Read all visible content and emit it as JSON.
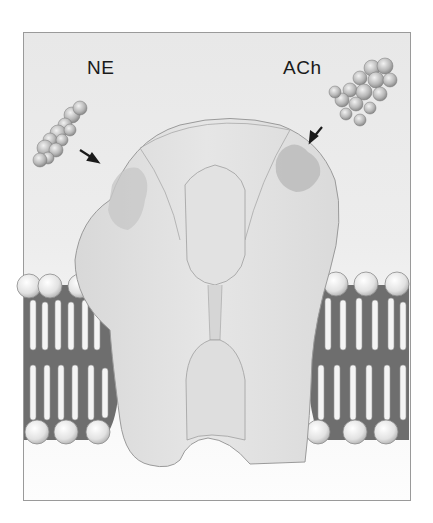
{
  "figure": {
    "labels": {
      "left_ligand": "NE",
      "right_ligand": "ACh"
    },
    "colors": {
      "background": "#ececec",
      "receptor": "#dcdcdc",
      "receptor_outline": "#9a9a9a",
      "binding_site": "#c4c4c4",
      "membrane_core": "#6e6e6e",
      "lipid_head": "#e6e6e6",
      "lipid_tail": "#f4f4f4",
      "arrow": "#1a1a1a"
    }
  }
}
